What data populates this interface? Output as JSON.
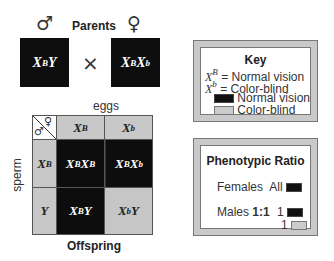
{
  "parents": {
    "title": "Parents",
    "male_symbol": "♂",
    "female_symbol": "♀",
    "cross_symbol": "×",
    "male": {
      "base1": "X",
      "sup1": "B",
      "base2": "Y",
      "sup2": ""
    },
    "female": {
      "base1": "X",
      "sup1": "B",
      "base2": "X",
      "sup2": "b"
    }
  },
  "punnett": {
    "top_label": "eggs",
    "side_label": "sperm",
    "bottom_label": "Offspring",
    "corner": {
      "male_symbol": "♂",
      "female_symbol": "♀"
    },
    "columns": [
      {
        "base": "X",
        "sup": "B"
      },
      {
        "base": "X",
        "sup": "b"
      }
    ],
    "rows": [
      {
        "base": "X",
        "sup": "B"
      },
      {
        "base": "Y",
        "sup": ""
      }
    ],
    "cells": [
      [
        {
          "base1": "X",
          "sup1": "B",
          "base2": "X",
          "sup2": "B",
          "phenotype": "Normal vision"
        },
        {
          "base1": "X",
          "sup1": "B",
          "base2": "X",
          "sup2": "b",
          "phenotype": "Normal vision"
        }
      ],
      [
        {
          "base1": "X",
          "sup1": "B",
          "base2": "Y",
          "sup2": "",
          "phenotype": "Normal vision"
        },
        {
          "base1": "X",
          "sup1": "b",
          "base2": "Y",
          "sup2": "",
          "phenotype": "Color-blind"
        }
      ]
    ]
  },
  "key": {
    "title": "Key",
    "items": [
      {
        "base": "X",
        "sup": "B",
        "text": "= Normal vision"
      },
      {
        "base": "X",
        "sup": "b",
        "text": "= Color-blind"
      }
    ],
    "legend": [
      {
        "label": "Normal vision",
        "color": "#111111"
      },
      {
        "label": "Color-blind",
        "color": "#cbcbcb"
      }
    ]
  },
  "phenotypic_ratio": {
    "title": "Phenotypic Ratio",
    "females_label": "Females",
    "females_value": "All",
    "males_label": "Males",
    "males_ratio": "1:1",
    "males_counts": [
      "1",
      "1"
    ]
  },
  "colors": {
    "normal_vision": "#0d0d0d",
    "color_blind": "#c6c6c6",
    "header": "#c8c8c8"
  }
}
